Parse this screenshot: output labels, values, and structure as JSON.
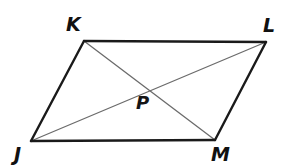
{
  "figure": {
    "kind": "geometry-diagram",
    "shape_name": "parallelogram",
    "background_color": "#ffffff",
    "side_color": "#1a1a1a",
    "side_width": 2.4,
    "diagonal_color": "#6b6b6b",
    "diagonal_width": 1.3,
    "vertices": [
      {
        "id": "K",
        "label": "K",
        "x": 84,
        "y": 41
      },
      {
        "id": "L",
        "label": "L",
        "x": 266,
        "y": 42
      },
      {
        "id": "M",
        "label": "M",
        "x": 215,
        "y": 140
      },
      {
        "id": "J",
        "label": "J",
        "x": 31,
        "y": 141
      }
    ],
    "intersection": {
      "id": "P",
      "label": "P",
      "x": 146,
      "y": 88
    },
    "sides": [
      {
        "name": "KL",
        "from": "K",
        "to": "L"
      },
      {
        "name": "LM",
        "from": "L",
        "to": "M"
      },
      {
        "name": "MJ",
        "from": "M",
        "to": "J"
      },
      {
        "name": "JK",
        "from": "J",
        "to": "K"
      }
    ],
    "diagonals": [
      {
        "name": "KM",
        "from": "K",
        "to": "M"
      },
      {
        "name": "JL",
        "from": "J",
        "to": "L"
      }
    ],
    "labels": [
      {
        "id": "label-K",
        "text": "K",
        "x": 66,
        "y": 15
      },
      {
        "id": "label-L",
        "text": "L",
        "x": 263,
        "y": 16
      },
      {
        "id": "label-J",
        "text": "J",
        "x": 14,
        "y": 145
      },
      {
        "id": "label-M",
        "text": "M",
        "x": 211,
        "y": 145
      },
      {
        "id": "label-P",
        "text": "P",
        "x": 136,
        "y": 94
      }
    ]
  }
}
